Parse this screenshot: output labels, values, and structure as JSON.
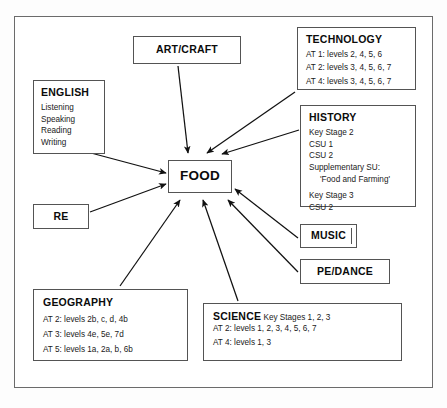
{
  "diagram": {
    "center": {
      "label": "FOOD"
    },
    "frame_color": "#6b6b6b",
    "box_border_color": "#545454",
    "arrow_color": "#111111",
    "background": "#ffffff"
  },
  "nodes": {
    "art_craft": {
      "title": "ART/CRAFT"
    },
    "re": {
      "title": "RE"
    },
    "music": {
      "title": "MUSIC"
    },
    "pe_dance": {
      "title": "PE/DANCE"
    },
    "english": {
      "title": "ENGLISH",
      "lines": [
        "Listening",
        "Speaking",
        "Reading",
        "Writing"
      ]
    },
    "technology": {
      "title": "TECHNOLOGY",
      "lines": [
        "AT 1: levels 2, 4, 5, 6",
        "AT 2: levels 3, 4, 5, 6, 7",
        "AT 4: levels 3, 4, 5, 6, 7"
      ]
    },
    "history": {
      "title": "HISTORY",
      "lines": [
        "Key Stage 2",
        "CSU 1",
        "CSU 2",
        "Supplementary SU:",
        "'Food and Farming'"
      ],
      "lines2": [
        "Key Stage 3",
        "CSU 2"
      ]
    },
    "geography": {
      "title": "GEOGRAPHY",
      "lines": [
        "AT 2: levels 2b, c, d, 4b",
        "AT 3: levels 4e, 5e, 7d",
        "AT 5: levels 1a, 2a, b, 6b"
      ]
    },
    "science": {
      "title": "SCIENCE",
      "subtitle": "Key Stages 1, 2, 3",
      "lines": [
        "AT 2: levels 1, 2, 3, 4, 5, 6, 7",
        "AT 4: levels 1, 3"
      ]
    }
  },
  "arrows": [
    {
      "from": "art_craft",
      "to": "food"
    },
    {
      "from": "technology",
      "to": "food"
    },
    {
      "from": "history",
      "to": "food"
    },
    {
      "from": "english",
      "to": "food"
    },
    {
      "from": "re",
      "to": "food"
    },
    {
      "from": "geography",
      "to": "food"
    },
    {
      "from": "science",
      "to": "food"
    },
    {
      "from": "music",
      "to": "food"
    },
    {
      "from": "pe_dance",
      "to": "food"
    }
  ]
}
